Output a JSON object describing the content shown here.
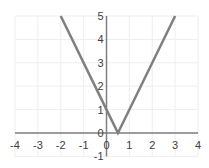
{
  "chart_data": {
    "type": "line",
    "title": "",
    "function": "y = |2x - 1|",
    "xlabel": "",
    "ylabel": "",
    "xlim": [
      -4,
      4
    ],
    "ylim": [
      -1,
      5
    ],
    "grid": true,
    "legend": "none",
    "x_ticks": [
      "-4",
      "-3",
      "-2",
      "-1",
      "0",
      "1",
      "2",
      "3",
      "4"
    ],
    "y_ticks": [
      "-1",
      "0",
      "1",
      "2",
      "3",
      "4",
      "5"
    ],
    "series": [
      {
        "name": "y = |2x - 1|",
        "color": "#7f7f7f",
        "points": [
          [
            -2,
            5
          ],
          [
            0,
            1
          ],
          [
            0.5,
            0
          ],
          [
            3,
            5
          ]
        ]
      }
    ]
  },
  "colors": {
    "line": "#7f7f7f",
    "axis": "#7f7f7f",
    "grid": "#eeeeee"
  }
}
